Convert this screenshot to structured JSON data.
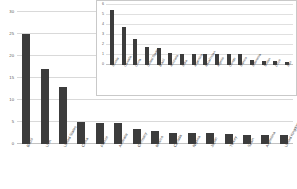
{
  "chart_data": [
    {
      "id": "main",
      "type": "bar",
      "title": "",
      "xlabel": "",
      "ylabel": "",
      "ylim": [
        0,
        30
      ],
      "yticks": [
        0,
        5,
        10,
        15,
        20,
        25,
        30
      ],
      "grid": true,
      "legend": "none",
      "bar_color": "#3c3c3c",
      "categories": [
        "Brazil",
        "USA",
        "United States",
        "China",
        "France",
        "Australia",
        "Germany",
        "Mexico",
        "Canada",
        "Nigeria",
        "Japan",
        "Turkey",
        "Spain",
        "Argentina",
        "United Kingdom"
      ],
      "values": [
        25.0,
        17.0,
        13.0,
        5.0,
        4.8,
        4.8,
        3.5,
        3.0,
        2.6,
        2.5,
        2.5,
        2.3,
        2.0,
        2.0,
        2.0
      ]
    },
    {
      "id": "inset",
      "type": "bar",
      "title": "",
      "xlabel": "",
      "ylabel": "",
      "ylim": [
        0,
        6
      ],
      "yticks": [
        0,
        1,
        2,
        3,
        4,
        5,
        6
      ],
      "grid": true,
      "legend": "none",
      "bar_color": "#3c3c3c",
      "categories": [
        "Russia",
        "Canada",
        "China",
        "United States",
        "Brazil",
        "Australia",
        "India",
        "Argentina",
        "Kazakhstan",
        "Algeria",
        "Congo",
        "Mexico",
        "Indonesia",
        "Sudan",
        "Libya",
        "Iran"
      ],
      "values": [
        5.5,
        3.8,
        2.6,
        1.8,
        1.7,
        1.2,
        1.1,
        1.1,
        1.1,
        1.1,
        1.1,
        1.1,
        0.5,
        0.45,
        0.4,
        0.35
      ]
    }
  ]
}
